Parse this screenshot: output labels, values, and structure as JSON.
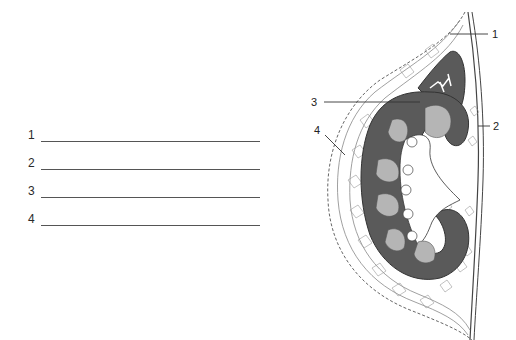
{
  "worksheet": {
    "answers": [
      {
        "number": "1",
        "value": ""
      },
      {
        "number": "2",
        "value": ""
      },
      {
        "number": "3",
        "value": ""
      },
      {
        "number": "4",
        "value": ""
      }
    ]
  },
  "figure": {
    "labels": [
      {
        "number": "1"
      },
      {
        "number": "2"
      },
      {
        "number": "3"
      },
      {
        "number": "4"
      }
    ],
    "colors": {
      "cortex": "#5a5a5a",
      "pyramids": "#b5b5b5",
      "fat_lines": "#777777",
      "background": "#ffffff"
    }
  }
}
